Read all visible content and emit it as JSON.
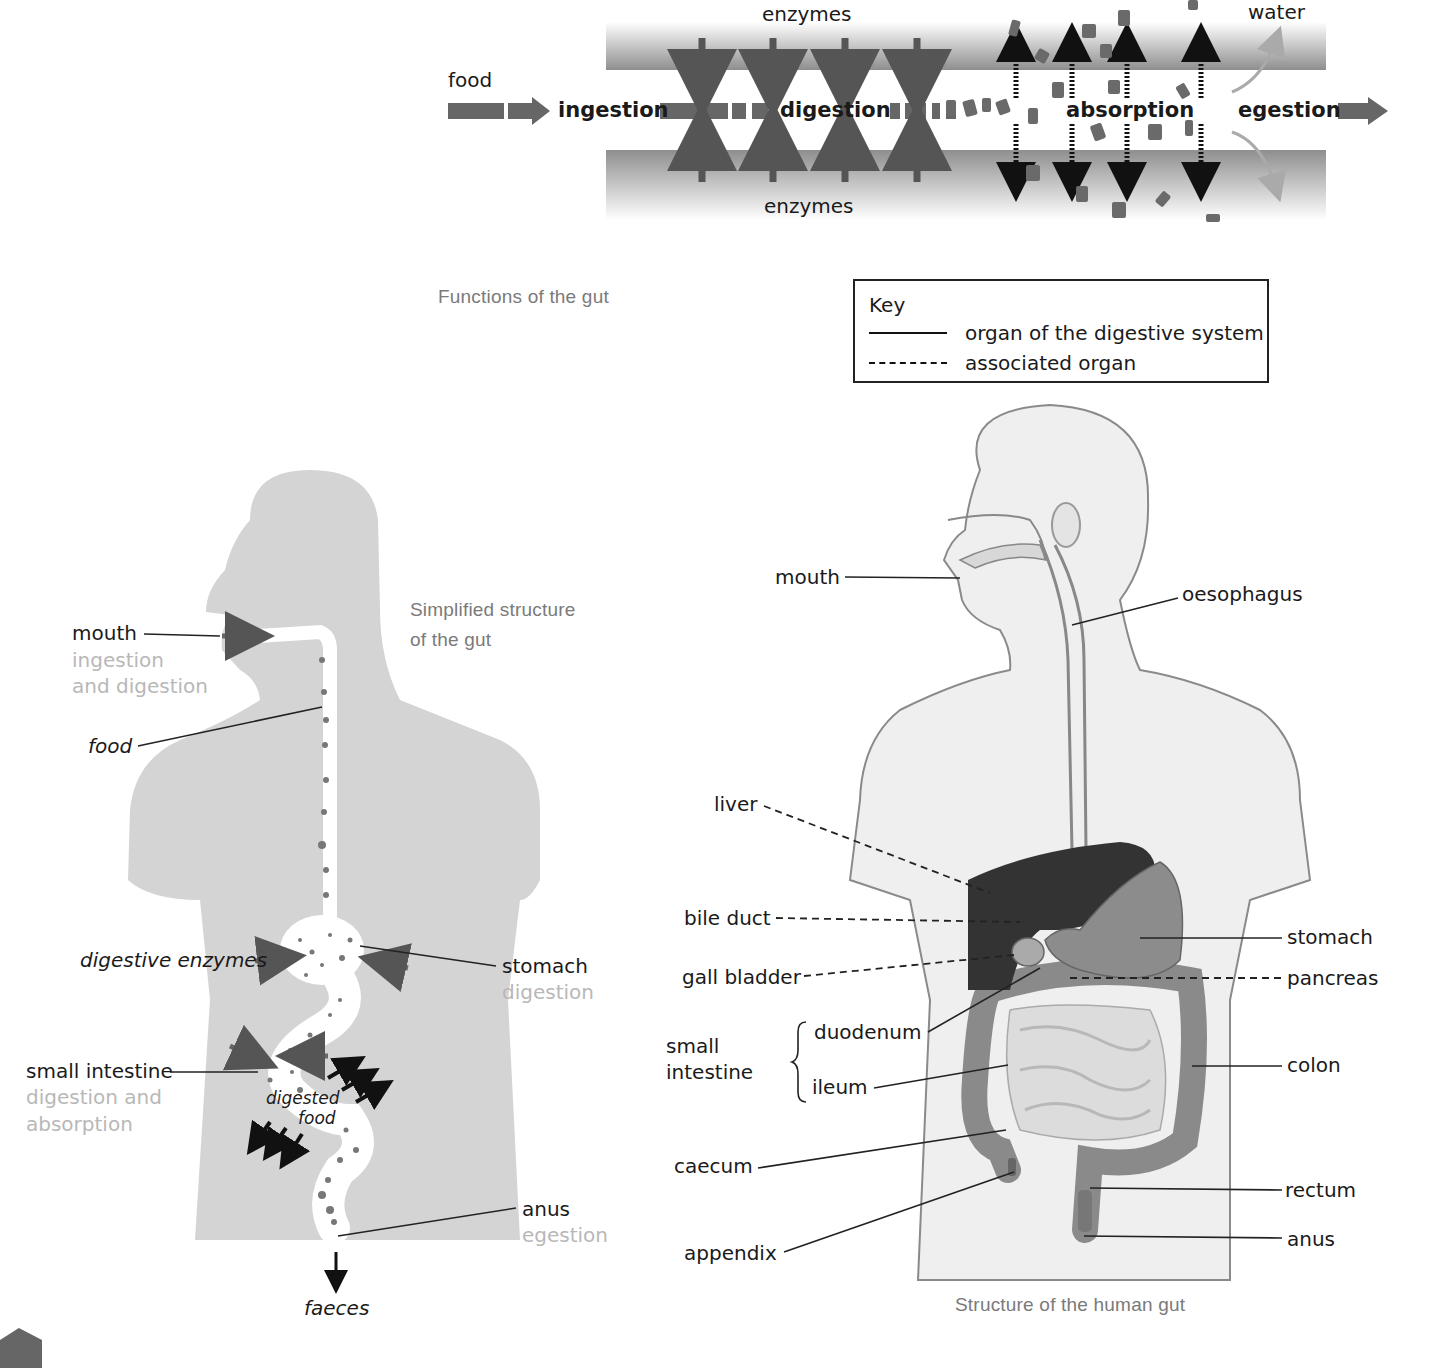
{
  "functions_diagram": {
    "caption": "Functions of the gut",
    "food_label": "food",
    "enzymes_top": "enzymes",
    "enzymes_bottom": "enzymes",
    "water_label": "water",
    "stages": [
      "ingestion",
      "digestion",
      "absorption",
      "egestion"
    ],
    "colors": {
      "wall": "#9a9a9a",
      "arrow": "#5a5a5a",
      "absorb_arrow": "#111111",
      "water_arrow": "#aaaaaa"
    }
  },
  "simplified_diagram": {
    "caption_line1": "Simplified structure",
    "caption_line2": "of the gut",
    "labels": {
      "mouth": "mouth",
      "mouth_function_1": "ingestion",
      "mouth_function_2": "and digestion",
      "food": "food",
      "digestive_enzymes": "digestive enzymes",
      "stomach": "stomach",
      "stomach_function": "digestion",
      "small_intestine": "small intestine",
      "small_intestine_function_1": "digestion and",
      "small_intestine_function_2": "absorption",
      "digested_food_1": "digested",
      "digested_food_2": "food",
      "anus": "anus",
      "anus_function": "egestion",
      "faeces": "faeces"
    },
    "colors": {
      "body": "#d4d4d4",
      "function_text": "#b8b8b8"
    }
  },
  "key": {
    "title": "Key",
    "items": [
      {
        "line": "solid",
        "label": "organ of the digestive system"
      },
      {
        "line": "dashed",
        "label": "associated organ"
      }
    ]
  },
  "structure_diagram": {
    "caption": "Structure of the human gut",
    "labels_left": {
      "mouth": "mouth",
      "liver": "liver",
      "bile_duct": "bile duct",
      "gall_bladder": "gall bladder",
      "small_intestine_1": "small",
      "small_intestine_2": "intestine",
      "duodenum": "duodenum",
      "ileum": "ileum",
      "caecum": "caecum",
      "appendix": "appendix"
    },
    "labels_right": {
      "oesophagus": "oesophagus",
      "stomach": "stomach",
      "pancreas": "pancreas",
      "colon": "colon",
      "rectum": "rectum",
      "anus": "anus"
    },
    "colors": {
      "body": "#eeeeee",
      "outline": "#8a8a8a",
      "liver": "#333333",
      "stomach": "#8c8c8c",
      "intestine": "#d8d8d8",
      "colon": "#8a8a8a"
    }
  }
}
